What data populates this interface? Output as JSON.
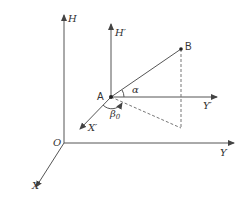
{
  "diagram": {
    "type": "3d-coordinate-geometry",
    "colors": {
      "axis": "#555555",
      "dashed": "#777777",
      "text": "#333333",
      "background": "#ffffff"
    },
    "axes": {
      "H": "H",
      "X": "X",
      "Y": "Y",
      "origin": "O"
    },
    "local_axes": {
      "H_prime": "H′",
      "X_prime": "X′",
      "Y_prime": "Y′"
    },
    "points": {
      "A": "A",
      "B": "B"
    },
    "angles": {
      "alpha": "α",
      "beta0": "β",
      "beta0_sub": "0"
    }
  }
}
